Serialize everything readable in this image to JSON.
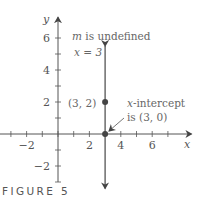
{
  "caption": "FIGURE 5",
  "chart_data": {
    "type": "line",
    "title": "",
    "xlabel": "x",
    "ylabel": "y",
    "xlim": [
      -3.7,
      8.5
    ],
    "ylim": [
      -3.0,
      7.3
    ],
    "x_ticks": [
      -3,
      -2,
      -1,
      0,
      1,
      2,
      3,
      4,
      5,
      6,
      7
    ],
    "x_tick_labels": [
      {
        "value": -2,
        "label": "−2"
      },
      {
        "value": 2,
        "label": "2"
      },
      {
        "value": 4,
        "label": "4"
      },
      {
        "value": 6,
        "label": "6"
      }
    ],
    "y_ticks": [
      -3,
      -2,
      -1,
      1,
      2,
      3,
      4,
      5,
      6
    ],
    "y_tick_labels": [
      {
        "value": -2,
        "label": "−2"
      },
      {
        "value": 2,
        "label": "2"
      },
      {
        "value": 4,
        "label": "4"
      },
      {
        "value": 6,
        "label": "6"
      }
    ],
    "grid": false,
    "series": [
      {
        "name": "x = 3",
        "kind": "vertical-line",
        "x": 3,
        "y_range": [
          -3.4,
          5.5
        ],
        "color": "#555555"
      }
    ],
    "points": [
      {
        "x": 3,
        "y": 2,
        "label": "(3, 2)"
      },
      {
        "x": 3,
        "y": 0,
        "label": "(3, 0)"
      }
    ],
    "annotations": [
      {
        "text_italic": "m",
        "text": " is undefined"
      },
      {
        "text": "x = 3"
      },
      {
        "text_italic": "x",
        "text": "-intercept"
      },
      {
        "text": "is (3, 0)"
      }
    ],
    "colors": {
      "line": "#555555",
      "text": "#555555",
      "point": "#444444"
    }
  }
}
